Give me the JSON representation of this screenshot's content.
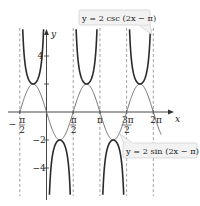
{
  "chart_data": {
    "type": "line",
    "title": "",
    "xlabel": "x",
    "ylabel": "y",
    "xlim": [
      -2.0,
      2.33
    ],
    "ylim": [
      -5.96,
      6.0
    ],
    "grid": false,
    "x_ticks": [
      {
        "value": -1.5708,
        "num": "π",
        "den": "2",
        "sign": "−"
      },
      {
        "value": 1.5708,
        "num": "π",
        "den": "2",
        "sign": ""
      },
      {
        "value": 3.1416,
        "label": "π"
      },
      {
        "value": 4.7124,
        "num": "3π",
        "den": "2",
        "sign": ""
      },
      {
        "value": 6.2832,
        "label": "2π"
      }
    ],
    "y_ticks": [
      {
        "value": 4,
        "label": "4"
      },
      {
        "value": 2,
        "label": ""
      },
      {
        "value": -2,
        "label": "−2"
      },
      {
        "value": -4,
        "label": "−4"
      }
    ],
    "asymptotes": [
      -1.5708,
      0,
      1.5708,
      3.1416,
      4.7124,
      6.2832
    ],
    "series": [
      {
        "name": "y = 2 sin (2x − π)",
        "function": "2*sin(2x-pi)",
        "x_range": [
          -1.5708,
          6.75
        ],
        "style": "thin-gray"
      },
      {
        "name": "y = 2 csc (2x − π)",
        "function": "2*csc(2x-pi)",
        "x_range": [
          -1.5708,
          6.2832
        ],
        "style": "thick-dark"
      }
    ],
    "annotations": [
      {
        "text": "y = 2 csc (2x − π)",
        "target": "csc branch near 2π"
      },
      {
        "text": "y = 2 sin (2x − π)",
        "target": "sine curve near 3π/2"
      }
    ]
  },
  "labels": {
    "x_axis": "x",
    "y_axis": "y",
    "csc_callout": "y = 2 csc (2x − π)",
    "sin_callout": "y = 2 sin (2x − π)"
  },
  "colors": {
    "csc_curve": "#2a2a2a",
    "sin_curve": "#6e6e6e",
    "axis": "#333333",
    "asymptote": "#8a8a8a",
    "callout_fill": "#f2f2f2",
    "callout_stroke": "#c8c8c8"
  }
}
